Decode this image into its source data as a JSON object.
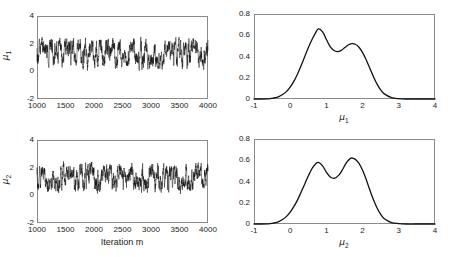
{
  "figure": {
    "width": 455,
    "height": 257,
    "background": "#ffffff",
    "line_color": "#111111",
    "axis_color": "#8a8a8a"
  },
  "panels": {
    "trace_mu1": {
      "name": "Trace plot of mu 1",
      "ylabel_base": "μ",
      "ylabel_sub": "1",
      "xlabel": "",
      "xticks": [
        "1000",
        "1500",
        "2000",
        "2500",
        "3000",
        "3500",
        "4000"
      ],
      "yticks": [
        "-2",
        "0",
        "2",
        "4"
      ]
    },
    "trace_mu2": {
      "name": "Trace plot of mu 2",
      "ylabel_base": "μ",
      "ylabel_sub": "2",
      "xlabel": "Iteration m",
      "xticks": [
        "1000",
        "1500",
        "2000",
        "2500",
        "3000",
        "3500",
        "4000"
      ],
      "yticks": [
        "-2",
        "0",
        "2",
        "4"
      ]
    },
    "density_mu1": {
      "name": "Posterior density of mu 1",
      "xlabel_base": "μ",
      "xlabel_sub": "1",
      "xticks": [
        "-1",
        "0",
        "1",
        "2",
        "3",
        "4"
      ],
      "yticks": [
        "0",
        "0.2",
        "0.4",
        "0.6",
        "0.8"
      ]
    },
    "density_mu2": {
      "name": "Posterior density of mu 2",
      "xlabel_base": "μ",
      "xlabel_sub": "2",
      "xticks": [
        "-1",
        "0",
        "1",
        "2",
        "3",
        "4"
      ],
      "yticks": [
        "0",
        "0.2",
        "0.4",
        "0.6",
        "0.8"
      ]
    }
  },
  "chart_data": [
    {
      "type": "line",
      "id": "trace-mu1",
      "title": "",
      "xlabel": "",
      "ylabel": "μ₁",
      "xlim": [
        1000,
        4000
      ],
      "ylim": [
        -2,
        4
      ],
      "xticks": [
        1000,
        1500,
        2000,
        2500,
        3000,
        3500,
        4000
      ],
      "yticks": [
        -2,
        0,
        2,
        4
      ],
      "grid": false,
      "legend": null,
      "description": "MCMC trace of mu_1 across iterations 1000-4000; rapidly oscillating chain mixing between a lower mode near 0.7 and an upper mode near 1.8, with values mostly contained between 0.1 and 2.6.",
      "series": [
        {
          "name": "mu_1 chain",
          "color": "#111111",
          "mean": 1.22,
          "min": 0.05,
          "max": 2.75,
          "mode_low": 0.75,
          "mode_high": 1.8
        }
      ]
    },
    {
      "type": "line",
      "id": "trace-mu2",
      "title": "",
      "xlabel": "Iteration m",
      "ylabel": "μ₂",
      "xlim": [
        1000,
        4000
      ],
      "ylim": [
        -2,
        4
      ],
      "xticks": [
        1000,
        1500,
        2000,
        2500,
        3000,
        3500,
        4000
      ],
      "yticks": [
        -2,
        0,
        2,
        4
      ],
      "grid": false,
      "legend": null,
      "description": "MCMC trace of mu_2 across iterations 1000-4000; similar bimodal mixing behaviour between modes near 0.8 and 1.75.",
      "series": [
        {
          "name": "mu_2 chain",
          "color": "#111111",
          "mean": 1.25,
          "min": 0.0,
          "max": 2.7,
          "mode_low": 0.8,
          "mode_high": 1.72
        }
      ]
    },
    {
      "type": "line",
      "id": "density-mu1",
      "title": "",
      "xlabel": "μ₁",
      "ylabel": "",
      "xlim": [
        -1,
        4
      ],
      "ylim": [
        0,
        0.8
      ],
      "xticks": [
        -1,
        0,
        1,
        2,
        3,
        4
      ],
      "yticks": [
        0,
        0.2,
        0.4,
        0.6,
        0.8
      ],
      "grid": false,
      "legend": null,
      "description": "Kernel density estimate of the posterior of mu_1; bimodal with a taller left mode at about 0.78 (height 0.66) and a lower right mode at about 1.70 (height 0.52), separated by a trough near 1.30 (height 0.445). Support roughly -0.6 to 3.2.",
      "x": [
        -1.0,
        -0.8,
        -0.6,
        -0.5,
        -0.4,
        -0.3,
        -0.2,
        -0.1,
        0.0,
        0.1,
        0.2,
        0.3,
        0.4,
        0.5,
        0.6,
        0.7,
        0.78,
        0.9,
        1.0,
        1.1,
        1.2,
        1.3,
        1.4,
        1.5,
        1.6,
        1.7,
        1.8,
        1.9,
        2.0,
        2.1,
        2.2,
        2.3,
        2.4,
        2.5,
        2.6,
        2.8,
        3.0,
        3.2,
        3.6,
        4.0
      ],
      "y": [
        0.0,
        0.0,
        0.002,
        0.006,
        0.013,
        0.025,
        0.044,
        0.072,
        0.112,
        0.166,
        0.233,
        0.312,
        0.398,
        0.483,
        0.558,
        0.622,
        0.66,
        0.63,
        0.56,
        0.495,
        0.458,
        0.445,
        0.455,
        0.482,
        0.508,
        0.521,
        0.515,
        0.487,
        0.437,
        0.368,
        0.29,
        0.21,
        0.14,
        0.085,
        0.048,
        0.013,
        0.003,
        0.0,
        0.0,
        0.0
      ]
    },
    {
      "type": "line",
      "id": "density-mu2",
      "title": "",
      "xlabel": "μ₂",
      "ylabel": "",
      "xlim": [
        -1,
        4
      ],
      "ylim": [
        0,
        0.8
      ],
      "xticks": [
        -1,
        0,
        1,
        2,
        3,
        4
      ],
      "yticks": [
        0,
        0.2,
        0.4,
        0.6,
        0.8
      ],
      "grid": false,
      "legend": null,
      "description": "Kernel density estimate of the posterior of mu_2; bimodal with a left mode at about 0.78 (height 0.58) and a slightly taller right mode at about 1.68 (height 0.62), separated by a trough near 1.22 (height 0.43). Support roughly -0.6 to 3.2.",
      "x": [
        -1.0,
        -0.8,
        -0.6,
        -0.5,
        -0.4,
        -0.3,
        -0.2,
        -0.1,
        0.0,
        0.1,
        0.2,
        0.3,
        0.4,
        0.5,
        0.6,
        0.7,
        0.78,
        0.9,
        1.0,
        1.1,
        1.22,
        1.35,
        1.45,
        1.55,
        1.68,
        1.8,
        1.9,
        2.0,
        2.1,
        2.2,
        2.3,
        2.4,
        2.5,
        2.6,
        2.8,
        3.0,
        3.2,
        3.6,
        4.0
      ],
      "y": [
        0.0,
        0.0,
        0.002,
        0.006,
        0.013,
        0.025,
        0.044,
        0.072,
        0.112,
        0.163,
        0.225,
        0.298,
        0.375,
        0.452,
        0.52,
        0.565,
        0.58,
        0.545,
        0.486,
        0.445,
        0.43,
        0.462,
        0.515,
        0.575,
        0.62,
        0.608,
        0.57,
        0.505,
        0.418,
        0.32,
        0.228,
        0.15,
        0.09,
        0.05,
        0.014,
        0.004,
        0.0,
        0.0,
        0.0
      ]
    }
  ]
}
